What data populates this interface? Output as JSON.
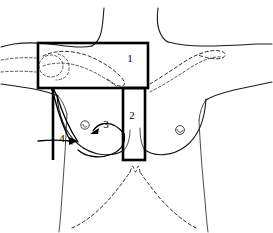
{
  "figure": {
    "background_color": "#ffffff",
    "line_color": "#000000",
    "outline_color": "#1a1a1a",
    "dashed_bone_color": "#2b2b2b"
  },
  "fields": [
    {
      "id": "field-1",
      "label": "1",
      "name": "supraclavicular-field",
      "shape": "rectangle",
      "x": 38,
      "y": 43,
      "width": 110,
      "height": 45,
      "label_x": 130,
      "label_y": 62
    },
    {
      "id": "field-2",
      "label": "2",
      "name": "internal-mammary-field",
      "shape": "rectangle",
      "x": 123,
      "y": 88,
      "width": 22,
      "height": 72,
      "label_x": 131,
      "label_y": 118
    }
  ],
  "field_edges": [
    {
      "id": "field-edge-left",
      "name": "medial-tangent-border",
      "x1": 53,
      "y1": 88,
      "x2": 53,
      "y2": 160
    }
  ],
  "arrows": [
    {
      "id": "arrow-3",
      "label": "3",
      "name": "medial-tangent-arrow",
      "label_x": 106,
      "label_y": 128,
      "direction": "left-down"
    },
    {
      "id": "arrow-4",
      "label": "4",
      "name": "lateral-tangent-arrow",
      "label_x": 61,
      "label_y": 142,
      "direction": "right"
    }
  ],
  "anatomy": [
    {
      "name": "neck-outline",
      "interactable": false
    },
    {
      "name": "shoulder-outline-left",
      "interactable": false
    },
    {
      "name": "shoulder-outline-right",
      "interactable": false
    },
    {
      "name": "clavicle-dashed-left",
      "interactable": false
    },
    {
      "name": "clavicle-dashed-right",
      "interactable": false
    },
    {
      "name": "breast-outline-left",
      "interactable": false
    },
    {
      "name": "breast-outline-right",
      "interactable": false
    },
    {
      "name": "nipple-left",
      "interactable": false
    },
    {
      "name": "nipple-right",
      "interactable": false
    },
    {
      "name": "ribcage-dashed-outline",
      "interactable": false
    },
    {
      "name": "torso-outline",
      "interactable": false
    }
  ]
}
